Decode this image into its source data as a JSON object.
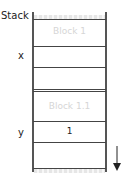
{
  "diagram": {
    "title": "Stack",
    "labels": {
      "x": "x",
      "y": "y"
    },
    "cells": [
      {
        "text": "Block 1",
        "style": "ghost"
      },
      {
        "text": "",
        "style": "normal"
      },
      {
        "text": "",
        "style": "normal"
      },
      {
        "text": "Block 1.1",
        "style": "ghost"
      },
      {
        "text": "1",
        "style": "normal"
      },
      {
        "text": "",
        "style": "normal"
      }
    ],
    "arrow": "down-arrow"
  }
}
